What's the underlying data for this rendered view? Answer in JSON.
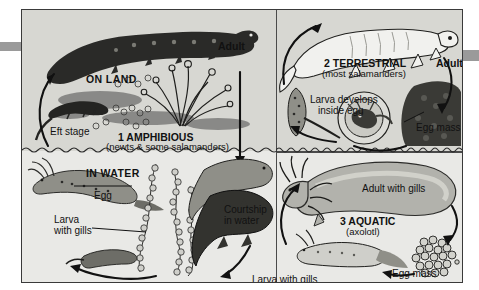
{
  "figure": {
    "background_color": "#d7d7d2",
    "water_background_color": "#e9e9e6",
    "border_color": "#3a3a3a",
    "edge_tab_color": "#9a9a9a"
  },
  "panels": {
    "amphibious": {
      "number_label": "1 AMPHIBIOUS",
      "subtitle": "(newts & some salamanders)",
      "zone_land": "ON LAND",
      "zone_water": "IN WATER",
      "labels": {
        "adult": "Adult",
        "eft_stage": "Eft stage",
        "egg": "Egg",
        "larva_with_gills": "Larva\nwith gills",
        "larva_with_gills_line1": "Larva",
        "larva_with_gills_line2": "with gills",
        "courtship_line1": "Courtship",
        "courtship_line2": "in water"
      }
    },
    "terrestrial": {
      "number_label": "2 TERRESTRIAL",
      "subtitle": "(most salamanders)",
      "labels": {
        "adult": "Adult",
        "larva_develops_line1": "Larva develops",
        "larva_develops_line2": "inside egg",
        "egg_mass": "Egg mass"
      }
    },
    "aquatic": {
      "number_label": "3 AQUATIC",
      "subtitle": "(axolotl)",
      "labels": {
        "adult_with_gills": "Adult with gills",
        "larva_with_gills": "Larva with gills",
        "egg_mass": "Egg mass"
      }
    }
  }
}
